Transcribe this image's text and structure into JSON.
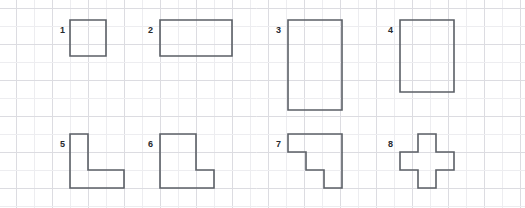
{
  "worksheet": {
    "width": 525,
    "height": 208,
    "background_color": "#ffffff",
    "shape_stroke_color": "#5b5f66",
    "label_color": "#26292e",
    "grid": {
      "cell_size": 18,
      "minor_line_color": "#ededf0",
      "major_line_color": "#dcdce1",
      "origin_x": 16,
      "origin_y": 8,
      "major_every": 1
    },
    "shapes": [
      {
        "label": "1",
        "name": "square-2x2",
        "label_x": 60,
        "label_y": 33,
        "points": "70,20 106,20 106,56 70,56"
      },
      {
        "label": "2",
        "name": "rectangle-4x2",
        "label_x": 148,
        "label_y": 33,
        "points": "160,20 232,20 232,56 160,56"
      },
      {
        "label": "3",
        "name": "rectangle-3x5",
        "label_x": 276,
        "label_y": 33,
        "points": "288,20 342,20 342,110 288,110"
      },
      {
        "label": "4",
        "name": "rectangle-3x4",
        "label_x": 388,
        "label_y": 33,
        "points": "400,20 454,20 454,92 400,92"
      },
      {
        "label": "5",
        "name": "l-shape-narrow",
        "label_x": 60,
        "label_y": 147,
        "points": "70,134 88,134 88,170 124,170 124,188 70,188"
      },
      {
        "label": "6",
        "name": "l-shape-wide",
        "label_x": 148,
        "label_y": 147,
        "points": "160,134 196,134 196,170 214,170 214,188 160,188"
      },
      {
        "label": "7",
        "name": "staircase-shape",
        "label_x": 276,
        "label_y": 147,
        "points": "288,134 342,134 342,188 324,188 324,170 306,170 306,152 288,152"
      },
      {
        "label": "8",
        "name": "plus-cross-shape",
        "label_x": 388,
        "label_y": 147,
        "points": "418,134 436,134 436,152 454,152 454,170 436,170 436,188 418,188 418,170 400,170 400,152 418,152"
      }
    ]
  }
}
